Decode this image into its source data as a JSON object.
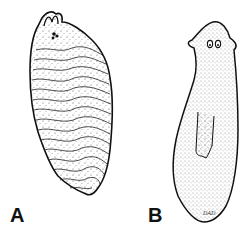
{
  "figure": {
    "panels": [
      {
        "label": "A",
        "subject": "flatworm-ruffled-dorsal-view",
        "style": "stippled line drawing with wavy transverse ridges"
      },
      {
        "label": "B",
        "subject": "planarian-dorsal-view",
        "style": "stippled line drawing with eyespots and pharynx"
      }
    ],
    "signature": "DAD",
    "colors": {
      "ink": "#111111",
      "background": "#ffffff"
    }
  }
}
